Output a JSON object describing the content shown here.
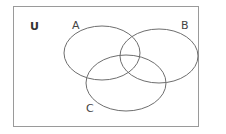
{
  "diagram": {
    "type": "venn",
    "universe_label": "U",
    "sets": [
      {
        "id": "A",
        "label": "A"
      },
      {
        "id": "B",
        "label": "B"
      },
      {
        "id": "C",
        "label": "C"
      }
    ],
    "colors": {
      "frame": "#9a9a9a",
      "outline": "#6e6e6e",
      "text": "#444444"
    }
  }
}
